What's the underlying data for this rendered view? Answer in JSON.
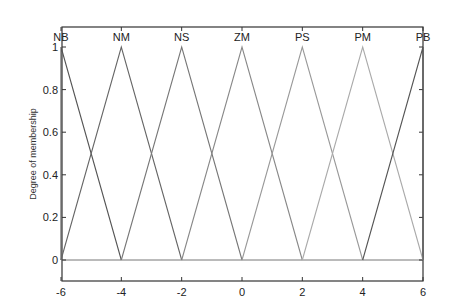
{
  "chart_data": {
    "type": "line",
    "title": "",
    "xlabel": "",
    "ylabel": "Degree of membership",
    "xlim": [
      -6,
      6
    ],
    "ylim": [
      0,
      1
    ],
    "xticks": [
      -6,
      -4,
      -2,
      0,
      2,
      4,
      6
    ],
    "yticks": [
      0,
      0.2,
      0.4,
      0.6,
      0.8,
      1
    ],
    "ytick_labels": [
      "0",
      "0.2",
      "0.4",
      "0.6",
      "0.8",
      "1"
    ],
    "xtick_labels": [
      "-6",
      "-4",
      "-2",
      "0",
      "2",
      "4",
      "6"
    ],
    "grid": false,
    "legend": "none",
    "series": [
      {
        "name": "NB",
        "x": [
          -6,
          -6,
          -4
        ],
        "y": [
          0,
          1,
          0
        ],
        "color": "#555555"
      },
      {
        "name": "NM",
        "x": [
          -6,
          -4,
          -2
        ],
        "y": [
          0,
          1,
          0
        ],
        "color": "#666666"
      },
      {
        "name": "NS",
        "x": [
          -4,
          -2,
          0
        ],
        "y": [
          0,
          1,
          0
        ],
        "color": "#777777"
      },
      {
        "name": "ZM",
        "x": [
          -2,
          0,
          2
        ],
        "y": [
          0,
          1,
          0
        ],
        "color": "#888888"
      },
      {
        "name": "PS",
        "x": [
          0,
          2,
          4
        ],
        "y": [
          0,
          1,
          0
        ],
        "color": "#999999"
      },
      {
        "name": "PM",
        "x": [
          2,
          4,
          6
        ],
        "y": [
          0,
          1,
          0
        ],
        "color": "#aaaaaa"
      },
      {
        "name": "PB",
        "x": [
          4,
          6,
          6
        ],
        "y": [
          0,
          1,
          0
        ],
        "color": "#555555"
      }
    ]
  }
}
